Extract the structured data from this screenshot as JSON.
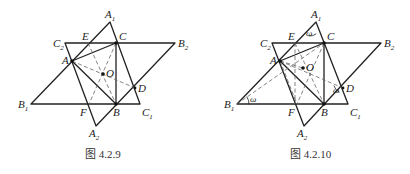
{
  "figures": [
    {
      "caption": "图 4.2.9",
      "labels": {
        "A1": "A",
        "A1_sub": "1",
        "A2": "A",
        "A2_sub": "2",
        "B1": "B",
        "B1_sub": "1",
        "B2": "B",
        "B2_sub": "2",
        "C1": "C",
        "C1_sub": "1",
        "C2": "C",
        "C2_sub": "2",
        "A": "A",
        "B": "B",
        "C": "C",
        "D": "D",
        "E": "E",
        "F": "F",
        "O": "O"
      }
    },
    {
      "caption": "图 4.2.10",
      "labels": {
        "A1": "A",
        "A1_sub": "1",
        "A2": "A",
        "A2_sub": "2",
        "B1": "B",
        "B1_sub": "1",
        "B2": "B",
        "B2_sub": "2",
        "C1": "C",
        "C1_sub": "1",
        "C2": "C",
        "C2_sub": "2",
        "A": "A",
        "B": "B",
        "C": "C",
        "D": "D",
        "E": "E",
        "F": "F",
        "O": "O",
        "omega": "ω"
      }
    }
  ]
}
